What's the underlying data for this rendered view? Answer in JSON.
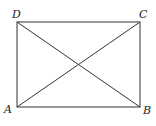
{
  "diagram": {
    "vertices": [
      {
        "label": "A",
        "x": 17,
        "y": 107
      },
      {
        "label": "B",
        "x": 140,
        "y": 107
      },
      {
        "label": "C",
        "x": 140,
        "y": 22
      },
      {
        "label": "D",
        "x": 17,
        "y": 22
      }
    ],
    "edges": [
      [
        "A",
        "B"
      ],
      [
        "B",
        "C"
      ],
      [
        "C",
        "D"
      ],
      [
        "D",
        "A"
      ]
    ],
    "diagonals": [
      [
        "A",
        "C"
      ],
      [
        "B",
        "D"
      ]
    ],
    "colors": {
      "line": "#333333",
      "text": "#222222",
      "background": "#ffffff"
    }
  }
}
